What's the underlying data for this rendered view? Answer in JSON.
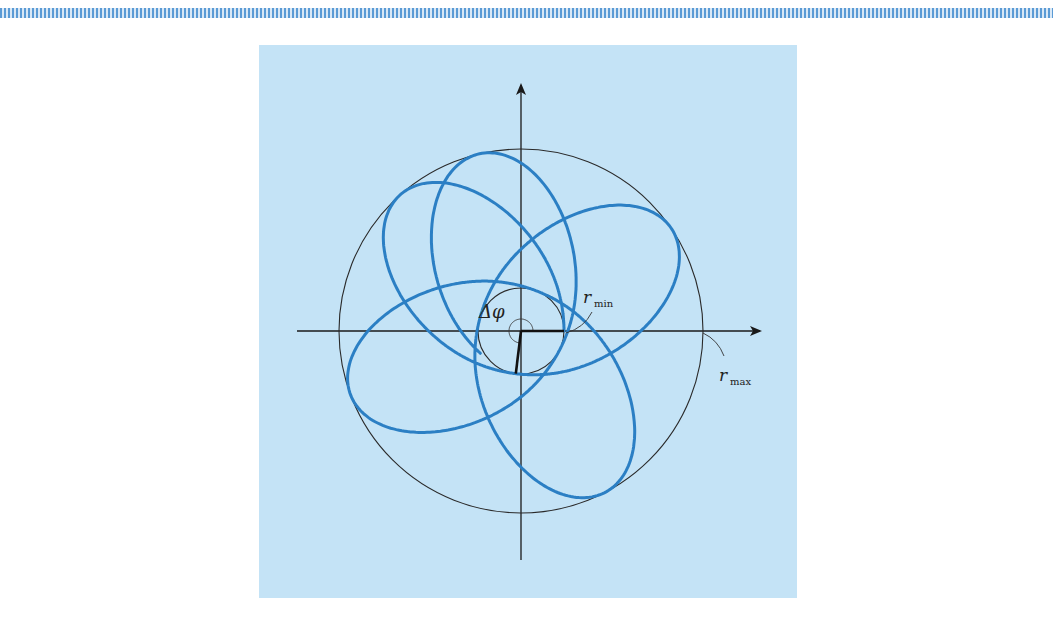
{
  "figure": {
    "background_color": "#c4e3f6",
    "stripe_color": "#5b9bd5",
    "orbit_color": "#2b7fc4",
    "axis_color": "#1a1a1a",
    "center": [
      521,
      331
    ],
    "r_min_px": 43,
    "r_max_px": 182,
    "delta_phi_deg": 263,
    "orbit_cycles": 4.9,
    "labels": {
      "delta_phi": "Δφ",
      "r_min_main": "r",
      "r_min_sub": "min",
      "r_max_main": "r",
      "r_max_sub": "max"
    }
  }
}
